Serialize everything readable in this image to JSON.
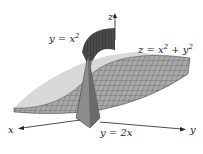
{
  "figure": {
    "axes": {
      "x": "x",
      "y": "y",
      "z": "z"
    },
    "labels": {
      "cylinder": "y = x",
      "cylinder_exp": "2",
      "paraboloid_pre": "z = x",
      "paraboloid_exp1": "2",
      "paraboloid_mid": " + y",
      "paraboloid_exp2": "2",
      "plane": "y = 2x"
    },
    "colors": {
      "surface": "#9a9a9a",
      "grid": "#333333",
      "dark": "#3a3a3a",
      "axis": "#222222"
    }
  }
}
